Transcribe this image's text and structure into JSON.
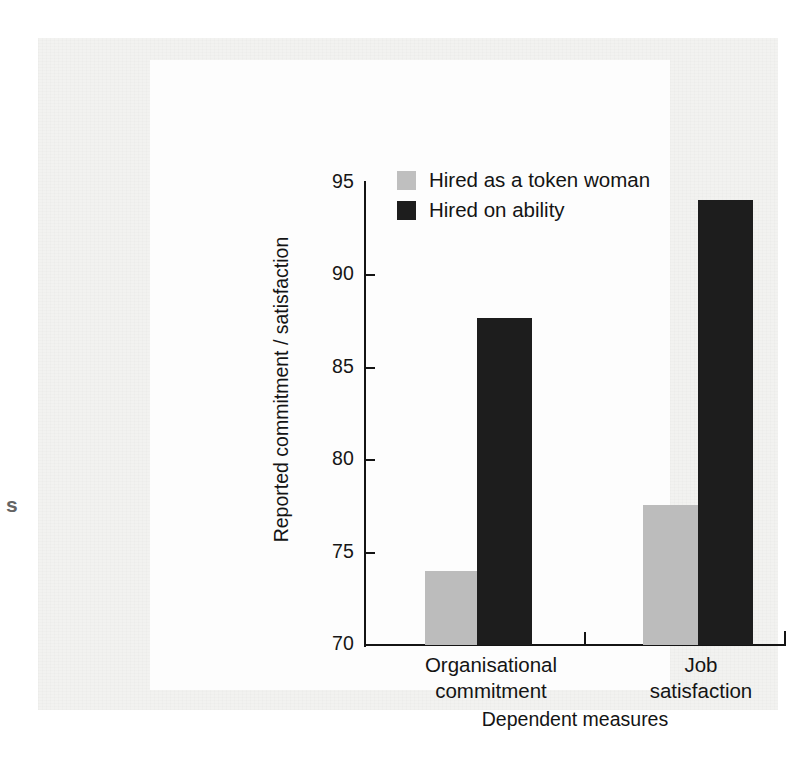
{
  "chart_data": {
    "type": "bar",
    "title": "",
    "subtitle": "",
    "xlabel": "Dependent measures",
    "ylabel": "Reported commitment / satisfaction",
    "categories": [
      "Organisational\ncommitment",
      "Job\nsatisfaction"
    ],
    "category_lines": [
      [
        "Organisational",
        "commitment"
      ],
      [
        "Job",
        "satisfaction"
      ]
    ],
    "series": [
      {
        "name": "Hired as a token woman",
        "color": "#bcbcbc",
        "values": [
          74.0,
          77.6
        ]
      },
      {
        "name": "Hired on ability",
        "color": "#1d1d1d",
        "values": [
          87.7,
          94.1
        ]
      }
    ],
    "ylim": [
      70,
      95
    ],
    "yticks": [
      70,
      75,
      80,
      85,
      90,
      95
    ],
    "ytick_labels": [
      "70",
      "75",
      "80",
      "85",
      "90",
      "95"
    ],
    "grid": false,
    "legend_position": "upper-left-inside",
    "orientation": "vertical",
    "grouped": true
  },
  "legend": {
    "items": [
      {
        "label": "Hired as a token woman",
        "swatch": "legend-swatch-token"
      },
      {
        "label": "Hired on ability",
        "swatch": "legend-swatch-ability"
      }
    ]
  },
  "page": {
    "margin_mark": "s"
  }
}
